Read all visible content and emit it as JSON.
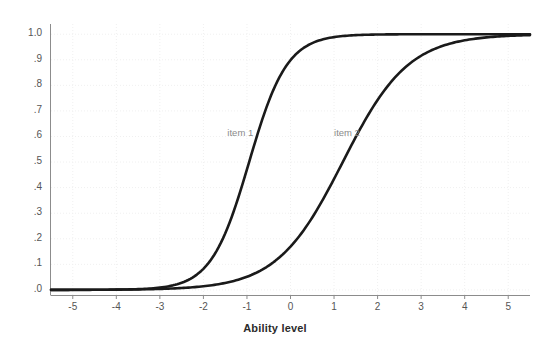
{
  "chart_data": {
    "type": "line",
    "title": "",
    "xlabel": "Ability level",
    "ylabel": "Probability of correct response",
    "xlim": [
      -5.5,
      5.5
    ],
    "ylim": [
      -0.02,
      1.04
    ],
    "grid": true,
    "grid_color": "#f0f0f0",
    "background": "#ffffff",
    "line_color": "#1a1a1a",
    "xticks": [
      -5,
      -4,
      -3,
      -2,
      -1,
      0,
      1,
      2,
      3,
      4,
      5
    ],
    "xtick_labels": [
      "-5",
      "-4",
      "-3",
      "-2",
      "-1",
      "0",
      "1",
      "2",
      "3",
      "4",
      "5"
    ],
    "yticks": [
      0.0,
      0.1,
      0.2,
      0.3,
      0.4,
      0.5,
      0.6,
      0.7,
      0.8,
      0.9,
      1.0
    ],
    "ytick_labels": [
      ".0",
      ".1",
      ".2",
      ".3",
      ".4",
      ".5",
      ".6",
      ".7",
      ".8",
      ".9",
      "1.0"
    ],
    "annotations": [
      {
        "text": "item 1",
        "x": -1.45,
        "y": 0.615
      },
      {
        "text": "item 2",
        "x": 1.0,
        "y": 0.615
      }
    ],
    "series": [
      {
        "name": "item 1",
        "model": "2PL",
        "discrimination": 1.35,
        "difficulty": -0.95,
        "guessing": 0.0,
        "x": [
          -5.5,
          -5.0,
          -4.5,
          -4.0,
          -3.5,
          -3.0,
          -2.5,
          -2.0,
          -1.5,
          -1.0,
          -0.5,
          0.0,
          0.5,
          1.0,
          1.5,
          2.0,
          2.5,
          3.0,
          3.5,
          4.0,
          4.5,
          5.0,
          5.5
        ],
        "y": [
          0.011,
          0.02,
          0.034,
          0.058,
          0.096,
          0.154,
          0.236,
          0.342,
          0.463,
          0.584,
          0.694,
          0.784,
          0.852,
          0.901,
          0.935,
          0.957,
          0.972,
          0.982,
          0.988,
          0.992,
          0.995,
          0.997,
          0.998
        ]
      },
      {
        "name": "item 2",
        "model": "2PL",
        "discrimination": 0.78,
        "difficulty": 1.2,
        "guessing": 0.0,
        "x": [
          -5.5,
          -5.0,
          -4.5,
          -4.0,
          -3.5,
          -3.0,
          -2.5,
          -2.0,
          -1.5,
          -1.0,
          -0.5,
          0.0,
          0.5,
          1.0,
          1.5,
          2.0,
          2.5,
          3.0,
          3.5,
          4.0,
          4.5,
          5.0,
          5.5
        ],
        "y": [
          0.005,
          0.007,
          0.011,
          0.016,
          0.023,
          0.034,
          0.05,
          0.072,
          0.103,
          0.146,
          0.202,
          0.274,
          0.359,
          0.452,
          0.548,
          0.639,
          0.72,
          0.788,
          0.843,
          0.885,
          0.917,
          0.941,
          0.958
        ]
      }
    ]
  }
}
